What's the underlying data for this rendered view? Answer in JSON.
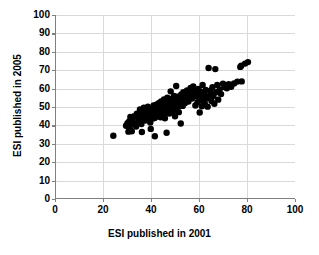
{
  "chart_data": {
    "type": "scatter",
    "title": "",
    "xlabel": "ESI published in 2001",
    "ylabel": "ESI published in 2005",
    "xlim": [
      0,
      100
    ],
    "ylim": [
      0,
      100
    ],
    "xticks": [
      0,
      20,
      40,
      60,
      80,
      100
    ],
    "yticks": [
      0,
      10,
      20,
      30,
      40,
      50,
      60,
      70,
      80,
      90,
      100
    ],
    "xtick_labels": [
      "0",
      "20",
      "40",
      "60",
      "80",
      "100"
    ],
    "ytick_labels": [
      "0",
      "10",
      "20",
      "30",
      "40",
      "50",
      "60",
      "70",
      "80",
      "90",
      "100"
    ],
    "grid": true,
    "grid_color": "#d9d9d9",
    "legend": null,
    "marker": "circle",
    "marker_color": "#000000",
    "marker_size": 3.2,
    "series": [
      {
        "name": "countries",
        "points": [
          [
            24.3,
            34.4
          ],
          [
            29.6,
            39.8
          ],
          [
            30.2,
            41.2
          ],
          [
            30.6,
            36.6
          ],
          [
            30.9,
            42.1
          ],
          [
            31.1,
            38.1
          ],
          [
            31.4,
            44.6
          ],
          [
            31.6,
            40.3
          ],
          [
            32.0,
            36.8
          ],
          [
            32.3,
            43.0
          ],
          [
            33.0,
            45.0
          ],
          [
            33.4,
            41.0
          ],
          [
            33.8,
            39.4
          ],
          [
            34.1,
            46.3
          ],
          [
            34.6,
            44.1
          ],
          [
            35.0,
            42.3
          ],
          [
            35.4,
            48.7
          ],
          [
            35.7,
            45.5
          ],
          [
            36.0,
            40.8
          ],
          [
            36.2,
            36.4
          ],
          [
            36.4,
            43.8
          ],
          [
            36.8,
            47.1
          ],
          [
            37.0,
            49.6
          ],
          [
            37.3,
            44.9
          ],
          [
            37.6,
            42.6
          ],
          [
            37.8,
            46.0
          ],
          [
            38.0,
            44.2
          ],
          [
            38.2,
            48.3
          ],
          [
            38.5,
            45.7
          ],
          [
            38.7,
            50.1
          ],
          [
            38.9,
            43.4
          ],
          [
            39.1,
            46.8
          ],
          [
            39.3,
            44.5
          ],
          [
            39.5,
            47.9
          ],
          [
            39.7,
            41.6
          ],
          [
            39.9,
            38.1
          ],
          [
            40.1,
            45.2
          ],
          [
            40.3,
            49.0
          ],
          [
            40.5,
            46.4
          ],
          [
            40.7,
            43.7
          ],
          [
            40.9,
            47.3
          ],
          [
            41.1,
            50.8
          ],
          [
            41.3,
            45.9
          ],
          [
            41.5,
            44.0
          ],
          [
            41.6,
            34.1
          ],
          [
            41.8,
            48.1
          ],
          [
            42.0,
            46.2
          ],
          [
            42.2,
            51.2
          ],
          [
            42.4,
            44.8
          ],
          [
            42.6,
            47.6
          ],
          [
            42.8,
            49.4
          ],
          [
            43.0,
            45.6
          ],
          [
            43.2,
            52.0
          ],
          [
            43.4,
            48.0
          ],
          [
            43.6,
            46.6
          ],
          [
            43.8,
            50.3
          ],
          [
            44.0,
            44.4
          ],
          [
            44.2,
            53.0
          ],
          [
            44.4,
            47.8
          ],
          [
            44.6,
            49.8
          ],
          [
            44.8,
            51.6
          ],
          [
            45.0,
            46.0
          ],
          [
            45.2,
            48.5
          ],
          [
            45.4,
            54.1
          ],
          [
            45.6,
            50.6
          ],
          [
            45.8,
            43.9
          ],
          [
            46.0,
            52.4
          ],
          [
            46.2,
            47.0
          ],
          [
            46.4,
            49.2
          ],
          [
            46.5,
            36.0
          ],
          [
            46.6,
            51.0
          ],
          [
            46.8,
            55.0
          ],
          [
            47.0,
            48.8
          ],
          [
            47.2,
            53.4
          ],
          [
            47.4,
            50.0
          ],
          [
            47.6,
            46.5
          ],
          [
            47.8,
            52.2
          ],
          [
            48.0,
            49.0
          ],
          [
            48.2,
            58.5
          ],
          [
            48.4,
            51.4
          ],
          [
            48.6,
            54.5
          ],
          [
            48.8,
            47.4
          ],
          [
            49.0,
            50.4
          ],
          [
            49.2,
            53.0
          ],
          [
            49.4,
            48.2
          ],
          [
            49.6,
            56.0
          ],
          [
            49.8,
            51.8
          ],
          [
            50.0,
            45.0
          ],
          [
            50.2,
            49.6
          ],
          [
            50.5,
            61.4
          ],
          [
            50.8,
            52.8
          ],
          [
            51.0,
            55.6
          ],
          [
            51.3,
            50.2
          ],
          [
            51.6,
            47.2
          ],
          [
            51.9,
            54.0
          ],
          [
            52.2,
            51.0
          ],
          [
            52.4,
            41.0
          ],
          [
            52.6,
            56.8
          ],
          [
            52.9,
            53.6
          ],
          [
            53.2,
            50.6
          ],
          [
            53.5,
            58.0
          ],
          [
            53.8,
            55.0
          ],
          [
            54.1,
            52.0
          ],
          [
            54.4,
            57.2
          ],
          [
            54.7,
            54.2
          ],
          [
            55.0,
            59.0
          ],
          [
            55.3,
            56.0
          ],
          [
            55.6,
            53.0
          ],
          [
            55.9,
            58.6
          ],
          [
            56.2,
            55.4
          ],
          [
            56.5,
            60.4
          ],
          [
            56.8,
            57.6
          ],
          [
            57.1,
            54.6
          ],
          [
            57.4,
            59.4
          ],
          [
            57.6,
            61.2
          ],
          [
            57.9,
            56.4
          ],
          [
            58.2,
            58.2
          ],
          [
            58.5,
            50.8
          ],
          [
            58.8,
            55.8
          ],
          [
            59.1,
            57.0
          ],
          [
            59.4,
            52.6
          ],
          [
            59.7,
            59.8
          ],
          [
            60.0,
            56.6
          ],
          [
            60.3,
            47.0
          ],
          [
            60.6,
            58.4
          ],
          [
            60.9,
            53.8
          ],
          [
            61.2,
            50.4
          ],
          [
            61.5,
            62.0
          ],
          [
            61.8,
            55.2
          ],
          [
            62.1,
            57.4
          ],
          [
            62.4,
            52.2
          ],
          [
            62.8,
            59.2
          ],
          [
            63.2,
            54.8
          ],
          [
            63.6,
            50.2
          ],
          [
            64.0,
            71.2
          ],
          [
            64.4,
            56.2
          ],
          [
            64.8,
            58.8
          ],
          [
            65.2,
            53.2
          ],
          [
            65.6,
            60.8
          ],
          [
            66.0,
            56.0
          ],
          [
            66.4,
            51.8
          ],
          [
            66.8,
            70.6
          ],
          [
            67.2,
            58.0
          ],
          [
            67.6,
            62.0
          ],
          [
            68.0,
            54.0
          ],
          [
            68.6,
            59.6
          ],
          [
            69.2,
            57.0
          ],
          [
            70.0,
            62.6
          ],
          [
            70.8,
            60.8
          ],
          [
            71.6,
            60.2
          ],
          [
            72.4,
            62.4
          ],
          [
            73.4,
            61.0
          ],
          [
            74.6,
            62.8
          ],
          [
            76.0,
            63.8
          ],
          [
            77.2,
            71.8
          ],
          [
            77.6,
            72.4
          ],
          [
            77.8,
            63.9
          ],
          [
            79.2,
            73.6
          ],
          [
            80.4,
            74.4
          ]
        ]
      }
    ]
  },
  "axis": {
    "x_title": "ESI published in 2001",
    "y_title": "ESI published in 2005"
  }
}
